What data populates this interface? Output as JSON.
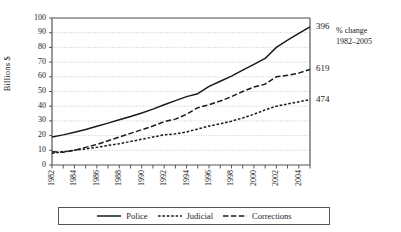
{
  "chart_data": {
    "type": "line",
    "title": "",
    "xlabel": "",
    "ylabel": "Billions $",
    "ylim": [
      0,
      100
    ],
    "ytick_step": 10,
    "yticks": [
      "100",
      "90",
      "80",
      "70",
      "60",
      "50",
      "40",
      "30",
      "20",
      "10",
      "0"
    ],
    "grid": true,
    "grid_axis": "y",
    "legend_position": "bottom",
    "x": [
      1982,
      1983,
      1984,
      1985,
      1986,
      1987,
      1988,
      1989,
      1990,
      1991,
      1992,
      1993,
      1994,
      1995,
      1996,
      1997,
      1998,
      1999,
      2000,
      2001,
      2002,
      2003,
      2004,
      2005
    ],
    "xtick_labels": [
      "1982",
      "1984",
      "1986",
      "1988",
      "1990",
      "1992",
      "1994",
      "1996",
      "1998",
      "2000",
      "2002",
      "2004"
    ],
    "xtick_label_years": [
      1982,
      1984,
      1986,
      1988,
      1990,
      1992,
      1994,
      1996,
      1998,
      2000,
      2002,
      2004
    ],
    "series": [
      {
        "name": "Police",
        "style": "solid",
        "values": [
          19.0,
          20.5,
          22.3,
          24.2,
          26.3,
          28.5,
          30.8,
          33.0,
          35.4,
          38.0,
          41.0,
          43.8,
          46.5,
          48.5,
          53.5,
          57.0,
          60.5,
          64.5,
          68.5,
          72.5,
          80.0,
          85.0,
          89.5,
          94.0
        ]
      },
      {
        "name": "Judicial",
        "style": "dotted",
        "values": [
          8.0,
          9.0,
          10.0,
          11.0,
          12.0,
          13.3,
          14.5,
          16.0,
          17.5,
          19.0,
          20.5,
          21.2,
          22.5,
          24.5,
          26.5,
          28.0,
          29.8,
          32.0,
          34.5,
          37.5,
          40.0,
          41.5,
          43.0,
          44.5
        ]
      },
      {
        "name": "Corrections",
        "style": "dashed",
        "values": [
          9.0,
          8.7,
          10.0,
          12.0,
          14.0,
          16.5,
          19.0,
          21.5,
          24.0,
          26.5,
          29.5,
          31.2,
          34.5,
          39.0,
          41.0,
          43.5,
          46.5,
          50.0,
          53.0,
          55.0,
          60.0,
          61.0,
          62.5,
          65.0
        ]
      }
    ],
    "right_annotations": [
      {
        "label": "396",
        "series": "Police",
        "value": 94.0
      },
      {
        "label": "619",
        "series": "Corrections",
        "value": 65.0
      },
      {
        "label": "474",
        "series": "Judicial",
        "value": 44.5
      }
    ],
    "right_caption": {
      "line1": "% change",
      "line2": "1982–2005"
    }
  },
  "colors": {
    "line": "#1a1a1a",
    "grid": "#b8b8b8",
    "axis": "#555555",
    "background": "#ffffff"
  },
  "legend": {
    "items": [
      {
        "label": "Police",
        "style": "solid"
      },
      {
        "label": "Judicial",
        "style": "dotted"
      },
      {
        "label": "Corrections",
        "style": "dashed"
      }
    ]
  }
}
